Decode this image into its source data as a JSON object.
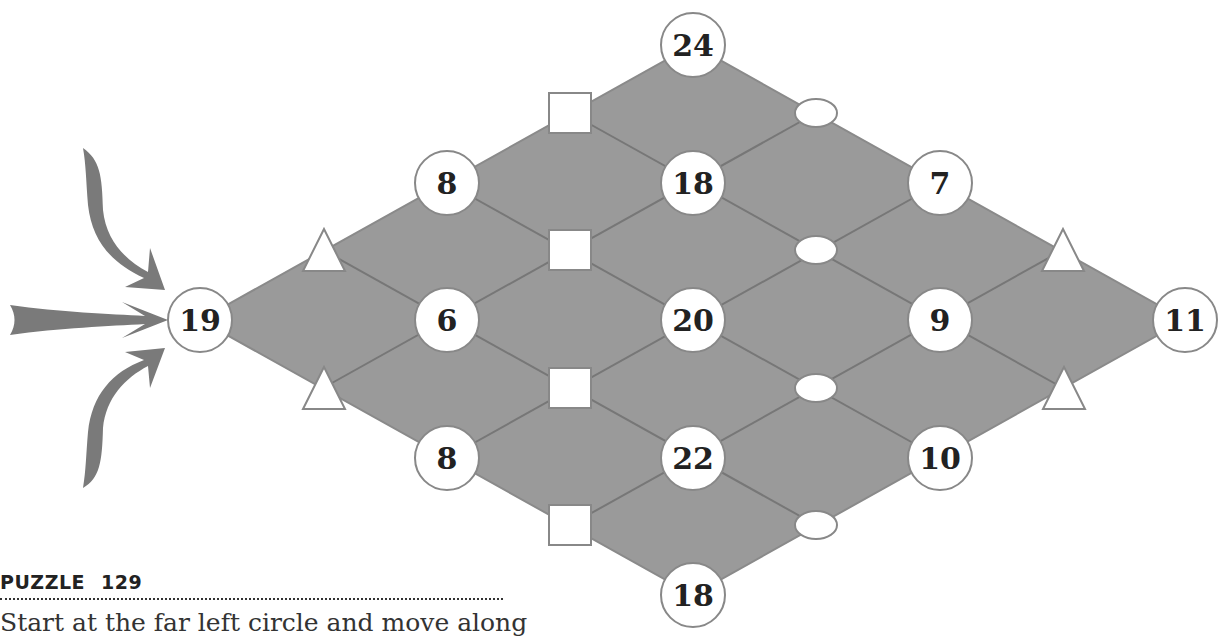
{
  "puzzle": {
    "label": "PUZZLE",
    "number": "129",
    "instruction": "Start at the far left circle and move along"
  },
  "colors": {
    "board_fill": "#9a9a9a",
    "line": "#777777",
    "node_fill": "#ffffff",
    "arrow": "#7a7a7a"
  },
  "nodes": [
    {
      "id": "n19",
      "value": "19",
      "x": 200,
      "y": 320
    },
    {
      "id": "n8a",
      "value": "8",
      "x": 447,
      "y": 183
    },
    {
      "id": "n6",
      "value": "6",
      "x": 447,
      "y": 320
    },
    {
      "id": "n8b",
      "value": "8",
      "x": 447,
      "y": 458
    },
    {
      "id": "n24",
      "value": "24",
      "x": 693,
      "y": 45
    },
    {
      "id": "n18a",
      "value": "18",
      "x": 693,
      "y": 183
    },
    {
      "id": "n20",
      "value": "20",
      "x": 693,
      "y": 320
    },
    {
      "id": "n22",
      "value": "22",
      "x": 693,
      "y": 458
    },
    {
      "id": "n18b",
      "value": "18",
      "x": 693,
      "y": 595
    },
    {
      "id": "n7",
      "value": "7",
      "x": 940,
      "y": 183
    },
    {
      "id": "n9",
      "value": "9",
      "x": 940,
      "y": 320
    },
    {
      "id": "n10",
      "value": "10",
      "x": 940,
      "y": 458
    },
    {
      "id": "n11",
      "value": "11",
      "x": 1185,
      "y": 320
    }
  ],
  "operators": {
    "squares": [
      [
        570,
        113
      ],
      [
        570,
        250
      ],
      [
        570,
        388
      ],
      [
        570,
        525
      ]
    ],
    "ovals": [
      [
        816,
        113
      ],
      [
        816,
        250
      ],
      [
        816,
        388
      ],
      [
        816,
        525
      ]
    ],
    "triangles": [
      [
        323,
        250
      ],
      [
        323,
        388
      ],
      [
        1063,
        250
      ],
      [
        1063,
        388
      ]
    ]
  }
}
